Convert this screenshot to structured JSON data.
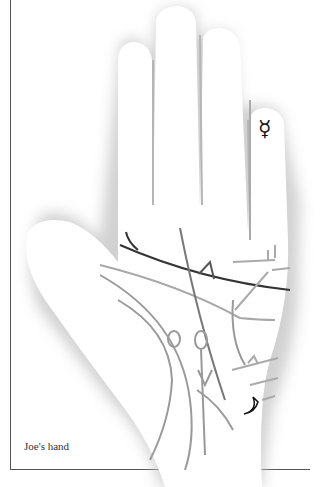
{
  "caption": "Joe's hand",
  "symbols": {
    "mercury": "☿",
    "moon": "crescent-moon"
  },
  "colors": {
    "heart_line": "#333333",
    "minor_lines": "#8a8a8a",
    "light_lines": "#a8a8a8",
    "shadow": "#c8c8c8",
    "frame": "#555555"
  }
}
